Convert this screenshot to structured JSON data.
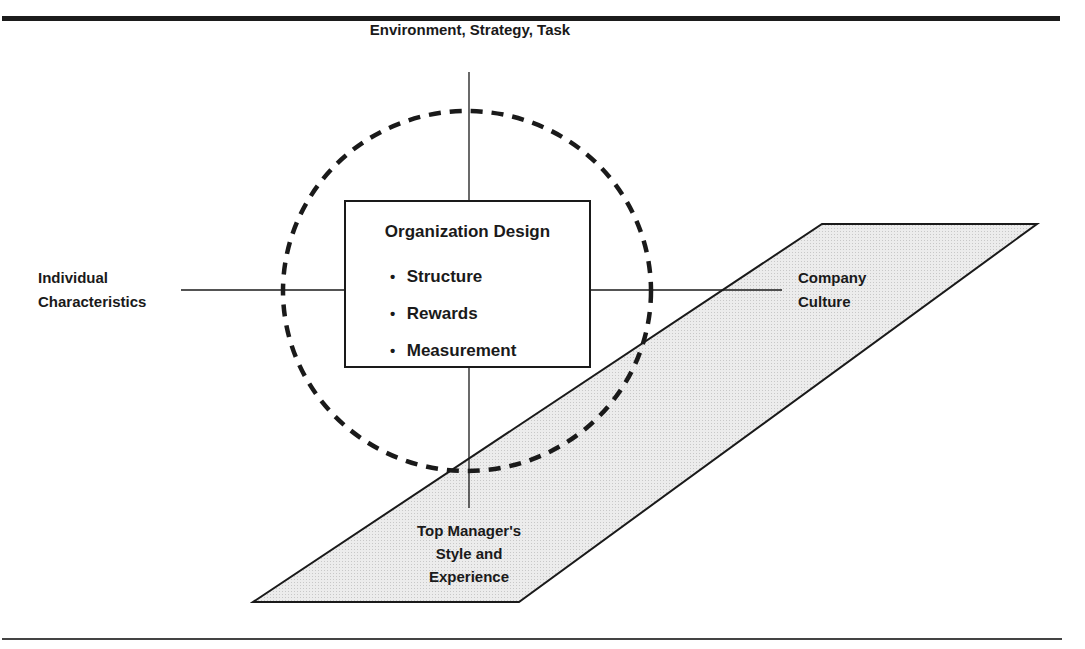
{
  "figure": {
    "top_rule": true,
    "bottom_rule": true
  },
  "diagram": {
    "center_box": {
      "title": "Organization Design",
      "bullet_glyph": "•",
      "items": [
        "Structure",
        "Rewards",
        "Measurement"
      ]
    },
    "factors": {
      "top": "Environment, Strategy, Task",
      "left": [
        "Individual",
        "Characteristics"
      ],
      "right": [
        "Company",
        "Culture"
      ],
      "bottom": [
        "Top Manager's",
        "Style and",
        "Experience"
      ]
    },
    "shapes": {
      "circle": {
        "style": "dashed",
        "cx": 467,
        "cy": 291,
        "rx": 184,
        "ry": 180
      },
      "parallelogram": {
        "fill": "#e9e9e9",
        "stroke": "#1a1a1a"
      }
    }
  }
}
